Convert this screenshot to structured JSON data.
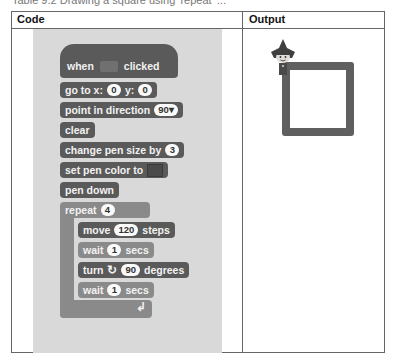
{
  "caption": "Table 9.2  Drawing a square using 'repeat' ...",
  "table": {
    "headers": [
      "Code",
      "Output"
    ]
  },
  "blocks": {
    "hat": {
      "before": "when",
      "icon": "green-flag-icon",
      "after": "clicked"
    },
    "goto": {
      "label1": "go to x:",
      "x": "0",
      "label2": "y:",
      "y": "0"
    },
    "point": {
      "label": "point in direction",
      "value": "90▾"
    },
    "clear": {
      "label": "clear"
    },
    "pen_size": {
      "label": "change pen size by",
      "value": "3"
    },
    "pen_color": {
      "label": "set pen color to",
      "color": "#4a4a4a"
    },
    "pen_down": {
      "label": "pen down"
    },
    "repeat": {
      "label": "repeat",
      "value": "4"
    },
    "move": {
      "label1": "move",
      "value": "120",
      "label2": "steps"
    },
    "wait1": {
      "label1": "wait",
      "value": "1",
      "label2": "secs"
    },
    "turn": {
      "label1": "turn",
      "icon": "↻",
      "value": "90",
      "label2": "degrees"
    },
    "wait2": {
      "label1": "wait",
      "value": "1",
      "label2": "secs"
    },
    "repeat_end_icon": "↲"
  },
  "output": {
    "shape": "square",
    "stroke_color": "#5f5f5f",
    "sprite": "sprite-character"
  }
}
